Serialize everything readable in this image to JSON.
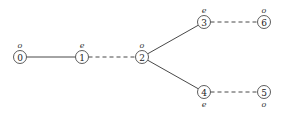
{
  "diagram": {
    "type": "tree-graph",
    "nodes": [
      {
        "id": "0",
        "label": "0",
        "parity": "o",
        "x": 20,
        "y": 57,
        "parity_pos": "above"
      },
      {
        "id": "1",
        "label": "1",
        "parity": "e",
        "x": 82,
        "y": 57,
        "parity_pos": "above"
      },
      {
        "id": "2",
        "label": "2",
        "parity": "o",
        "x": 142,
        "y": 57,
        "parity_pos": "above"
      },
      {
        "id": "3",
        "label": "3",
        "parity": "e",
        "x": 204,
        "y": 22,
        "parity_pos": "above"
      },
      {
        "id": "6",
        "label": "6",
        "parity": "o",
        "x": 264,
        "y": 22,
        "parity_pos": "above"
      },
      {
        "id": "4",
        "label": "4",
        "parity": "e",
        "x": 204,
        "y": 92,
        "parity_pos": "below"
      },
      {
        "id": "5",
        "label": "5",
        "parity": "o",
        "x": 264,
        "y": 92,
        "parity_pos": "below"
      }
    ],
    "edges": [
      {
        "from": "0",
        "to": "1",
        "style": "solid"
      },
      {
        "from": "1",
        "to": "2",
        "style": "dashed"
      },
      {
        "from": "2",
        "to": "3",
        "style": "solid"
      },
      {
        "from": "2",
        "to": "4",
        "style": "solid"
      },
      {
        "from": "3",
        "to": "6",
        "style": "dashed"
      },
      {
        "from": "4",
        "to": "5",
        "style": "dashed"
      }
    ],
    "node_radius": 6.5,
    "colors": {
      "stroke": "#333333",
      "background": "#ffffff"
    }
  }
}
